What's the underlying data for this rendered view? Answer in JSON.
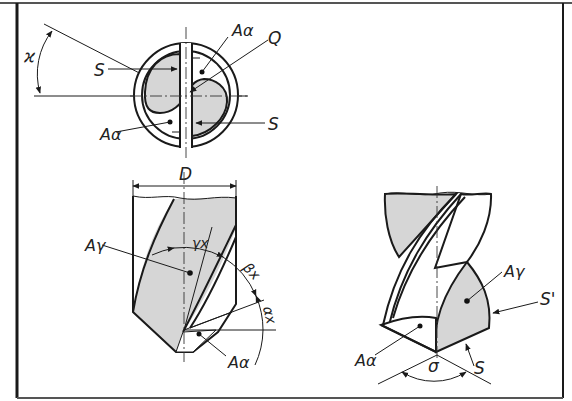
{
  "figure": {
    "colors": {
      "border": "#1a1a1a",
      "fill_gray": "#d6d6d6",
      "background": "#ffffff"
    },
    "end_view": {
      "angle_label": "ϰ",
      "cutting_edge_left": "S",
      "cutting_edge_right": "S",
      "flank_top": "Aα",
      "flank_bottom": "Aα",
      "chisel_edge": "Q"
    },
    "side_view": {
      "diameter_label": "D",
      "rake_face": "Aγ",
      "rake_angle": "γx",
      "wedge_angle": "βx",
      "clearance_angle": "αx",
      "flank_face": "Aα"
    },
    "perspective_view": {
      "rake_face": "Aγ",
      "flank_face": "Aα",
      "minor_edge": "S'",
      "main_edge": "S",
      "point_angle": "σ"
    }
  }
}
